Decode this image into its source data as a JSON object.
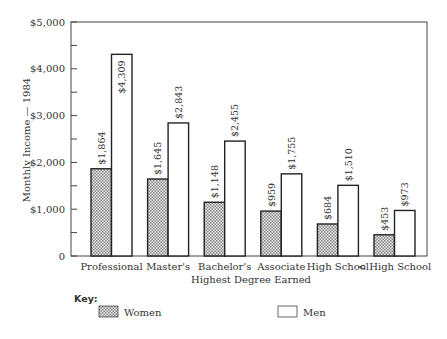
{
  "chart_data": {
    "type": "bar",
    "title": "",
    "xlabel": "Highest Degree Earned",
    "ylabel": "Monthly Income — 1984",
    "ylim": [
      0,
      5000
    ],
    "yticks": [
      0,
      1000,
      2000,
      3000,
      4000,
      5000
    ],
    "ytick_labels": [
      "0",
      "$1,000",
      "$2,000",
      "$3,000",
      "$4,000",
      "$5,000"
    ],
    "grid": false,
    "legend_position": "bottom",
    "legend_title": "Key:",
    "categories": [
      "Professional",
      "Master's",
      "Bachelor's",
      "Associate",
      "High School",
      "< High School"
    ],
    "series": [
      {
        "name": "Women",
        "pattern": "crosshatch",
        "values": [
          1864,
          1645,
          1148,
          959,
          684,
          453
        ],
        "labels": [
          "$1,864",
          "$1,645",
          "$1,148",
          "$959",
          "$684",
          "$453"
        ]
      },
      {
        "name": "Men",
        "pattern": "none",
        "values": [
          4309,
          2843,
          2455,
          1755,
          1510,
          973
        ],
        "labels": [
          "$4,309",
          "$2,843",
          "$2,455",
          "$1,755",
          "$1,510",
          "$973"
        ]
      }
    ]
  }
}
